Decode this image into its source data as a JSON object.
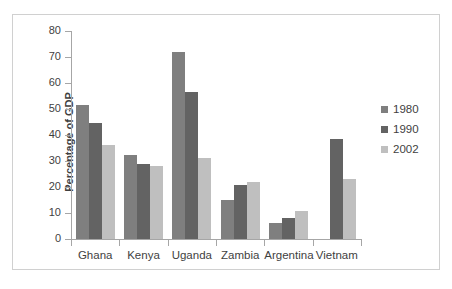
{
  "chart_data": {
    "type": "bar",
    "title": "",
    "subtitle": "",
    "xlabel": "",
    "ylabel": "Percentage of GDP",
    "ylim": [
      0,
      80
    ],
    "yticks": [
      0,
      10,
      20,
      30,
      40,
      50,
      60,
      70,
      80
    ],
    "ytick_labels": [
      "0",
      "10",
      "20",
      "30",
      "40",
      "50",
      "60",
      "70",
      "80"
    ],
    "grid": false,
    "legend_position": "right",
    "categories": [
      "Ghana",
      "Kenya",
      "Uganda",
      "Zambia",
      "Argentina",
      "Vietnam"
    ],
    "series": [
      {
        "name": "1980",
        "color": "#7f7f7f",
        "values": [
          51.5,
          32.5,
          72.0,
          15.0,
          6.2,
          null
        ]
      },
      {
        "name": "1990",
        "color": "#636363",
        "values": [
          44.7,
          29.0,
          56.5,
          20.6,
          8.0,
          38.6
        ]
      },
      {
        "name": "2002",
        "color": "#bfbfbf",
        "values": [
          36.0,
          28.2,
          31.0,
          22.1,
          10.8,
          23.0
        ]
      }
    ]
  },
  "axis": {
    "y_title": "Percentage of GDP"
  },
  "legend": {
    "items": [
      {
        "label": "1980",
        "color": "#7f7f7f"
      },
      {
        "label": "1990",
        "color": "#636363"
      },
      {
        "label": "2002",
        "color": "#bfbfbf"
      }
    ]
  },
  "colors": {
    "axis_line": "#a6a6a6",
    "tick_text": "#3f3f3f",
    "frame_border": "#d0d0d0",
    "background": "#ffffff"
  }
}
